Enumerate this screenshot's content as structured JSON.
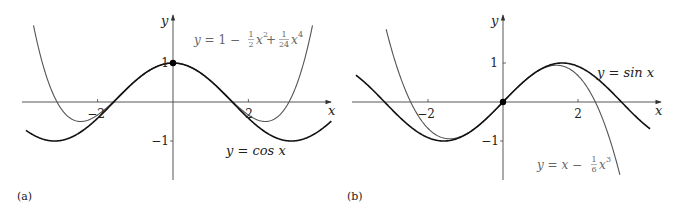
{
  "chart_data": [
    {
      "type": "line",
      "panel": "(a)",
      "title": "",
      "xlabel": "x",
      "ylabel": "y",
      "xlim": [
        -4,
        4.2
      ],
      "ylim": [
        -1.9,
        2.2
      ],
      "x_ticks": [
        -2,
        2
      ],
      "x_tick_labels": [
        "−2",
        "2"
      ],
      "y_ticks": [
        1,
        -1
      ],
      "y_tick_labels": [
        "1",
        "−1"
      ],
      "grid": false,
      "series": [
        {
          "name": "y = cos x",
          "function": "cos(x)",
          "color": "#111111",
          "x_range": [
            -3.9,
            4.2
          ]
        },
        {
          "name": "y = 1 − ½x² + (1/24)x⁴",
          "function": "1 - x^2/2 + x^4/24",
          "color": "#555555",
          "x_range": [
            -3.8,
            3.9
          ]
        }
      ],
      "marked_point": {
        "x": 0,
        "y": 1
      },
      "annotations": [
        {
          "text": "y = cos x",
          "near": [
            2.8,
            -1.2
          ]
        },
        {
          "text": "y = 1 − ½x² + (1/24)x⁴",
          "near": [
            2.6,
            2.0
          ]
        }
      ]
    },
    {
      "type": "line",
      "panel": "(b)",
      "title": "",
      "xlabel": "x",
      "ylabel": "y",
      "xlim": [
        -4,
        4.2
      ],
      "ylim": [
        -1.9,
        2.2
      ],
      "x_ticks": [
        -2,
        2
      ],
      "x_tick_labels": [
        "−2",
        "2"
      ],
      "y_ticks": [
        1,
        -1
      ],
      "y_tick_labels": [
        "1",
        "−1"
      ],
      "grid": false,
      "series": [
        {
          "name": "y = sin x",
          "function": "sin(x)",
          "color": "#111111",
          "x_range": [
            -3.9,
            3.9
          ]
        },
        {
          "name": "y = x − (1/6)x³",
          "function": "x - x^3/6",
          "color": "#555555",
          "x_range": [
            -3.1,
            3.1
          ]
        }
      ],
      "marked_point": {
        "x": 0,
        "y": 0
      },
      "annotations": [
        {
          "text": "y = sin x",
          "near": [
            3.0,
            0.8
          ]
        },
        {
          "text": "y = x − (1/6)x³",
          "near": [
            1.5,
            -1.5
          ]
        }
      ]
    }
  ],
  "panels": {
    "a": {
      "caption": "(a)",
      "x_axis_label": "x",
      "y_axis_label": "y",
      "tick_neg2": "−2",
      "tick_pos2": "2",
      "tick_y1": "1",
      "tick_yneg1": "−1",
      "label_cos_prefix": "y = cos ",
      "label_cos_var": "x",
      "label_taylor_y": "y",
      "label_taylor_eq": " = 1 − ",
      "label_taylor_frac1_num": "1",
      "label_taylor_frac1_den": "2",
      "label_taylor_x2": "x",
      "label_taylor_exp2": "2",
      "label_taylor_plus": " + ",
      "label_taylor_frac2_num": "1",
      "label_taylor_frac2_den": "24",
      "label_taylor_x4": "x",
      "label_taylor_exp4": "4"
    },
    "b": {
      "caption": "(b)",
      "x_axis_label": "x",
      "y_axis_label": "y",
      "tick_neg2": "−2",
      "tick_pos2": "2",
      "tick_y1": "1",
      "tick_yneg1": "−1",
      "label_sin_prefix": "y = sin ",
      "label_sin_var": "x",
      "label_taylor_y": "y",
      "label_taylor_eq": " = ",
      "label_taylor_x": "x",
      "label_taylor_minus": " − ",
      "label_taylor_frac_num": "1",
      "label_taylor_frac_den": "6",
      "label_taylor_x3": "x",
      "label_taylor_exp3": "3"
    }
  }
}
